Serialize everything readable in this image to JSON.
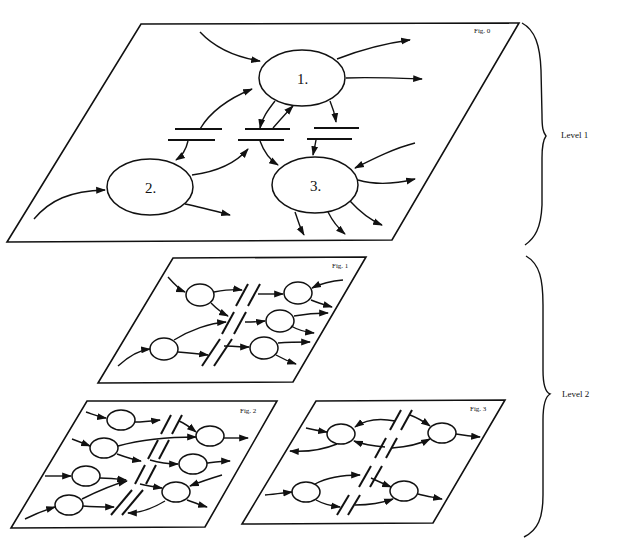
{
  "figures": {
    "fig0": {
      "label": "Fig. 0",
      "nodes": [
        "1.",
        "2.",
        "3."
      ]
    },
    "fig1": {
      "label": "Fig. 1"
    },
    "fig2": {
      "label": "Fig. 2"
    },
    "fig3": {
      "label": "Fig. 3"
    }
  },
  "levels": [
    {
      "label": "Level 1"
    },
    {
      "label": "Level 2"
    }
  ]
}
